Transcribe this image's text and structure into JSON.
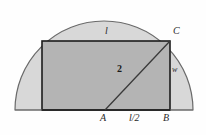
{
  "figure": {
    "type": "geometry-diagram",
    "colors": {
      "semicircle_fill": "#d8d8d8",
      "rectangle_fill": "#b4b4b4",
      "outline_stroke": "#6a6a6a",
      "rectangle_stroke": "#1c1c1c",
      "diagonal_stroke": "#3a3a3a",
      "background": "#fefefe",
      "label_color": "#2a2a2a"
    },
    "geometry": {
      "semicircle": {
        "cx": 104,
        "cy": 110,
        "r": 89
      },
      "rectangle": {
        "x": 42,
        "y": 41,
        "width": 128,
        "height": 69
      },
      "diagonal": {
        "x1": 105,
        "y1": 110,
        "x2": 170,
        "y2": 41
      },
      "baseline": {
        "x1": 15,
        "y1": 110,
        "x2": 193,
        "y2": 110
      }
    },
    "labels": {
      "top_length": "l",
      "vertex_c": "C",
      "width": "w",
      "diagonal": "2",
      "vertex_a": "A",
      "half_length": "l/2",
      "vertex_b": "B"
    }
  }
}
